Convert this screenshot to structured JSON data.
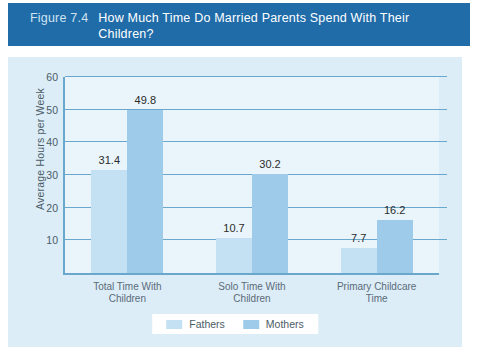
{
  "figure": {
    "number": "Figure 7.4",
    "title": "How Much Time Do Married Parents Spend With Their Children?"
  },
  "colors": {
    "banner": "#1f6ca9",
    "panel": "#dcedf8",
    "plot_background": "#e9f5fb",
    "axis": "#6aa7cd",
    "fathers": "#c4e0f3",
    "mothers": "#9dcbe9",
    "label_text": "#4a5b66",
    "value_text": "#2b2b2b"
  },
  "chart_data": {
    "type": "bar",
    "title": "How Much Time Do Married Parents Spend With Their Children?",
    "xlabel": "",
    "ylabel": "Average Hours per Week",
    "ylim": [
      0,
      60
    ],
    "yticks": [
      0,
      10,
      20,
      30,
      40,
      50,
      60
    ],
    "ytick_labels": [
      "0",
      "10",
      "20",
      "30",
      "40",
      "50",
      "60"
    ],
    "grid": true,
    "legend_position": "bottom-center",
    "categories": [
      "Total Time With Children",
      "Solo Time With Children",
      "Primary Childcare Time"
    ],
    "category_lines": [
      [
        "Total Time With",
        "Children"
      ],
      [
        "Solo Time With",
        "Children"
      ],
      [
        "Primary Childcare",
        "Time"
      ]
    ],
    "series": [
      {
        "name": "Fathers",
        "color": "#c4e0f3",
        "values": [
          31.4,
          10.7,
          7.7
        ],
        "value_labels": [
          "31.4",
          "10.7",
          "7.7"
        ]
      },
      {
        "name": "Mothers",
        "color": "#9dcbe9",
        "values": [
          49.8,
          30.2,
          16.2
        ],
        "value_labels": [
          "49.8",
          "30.2",
          "16.2"
        ]
      }
    ]
  }
}
